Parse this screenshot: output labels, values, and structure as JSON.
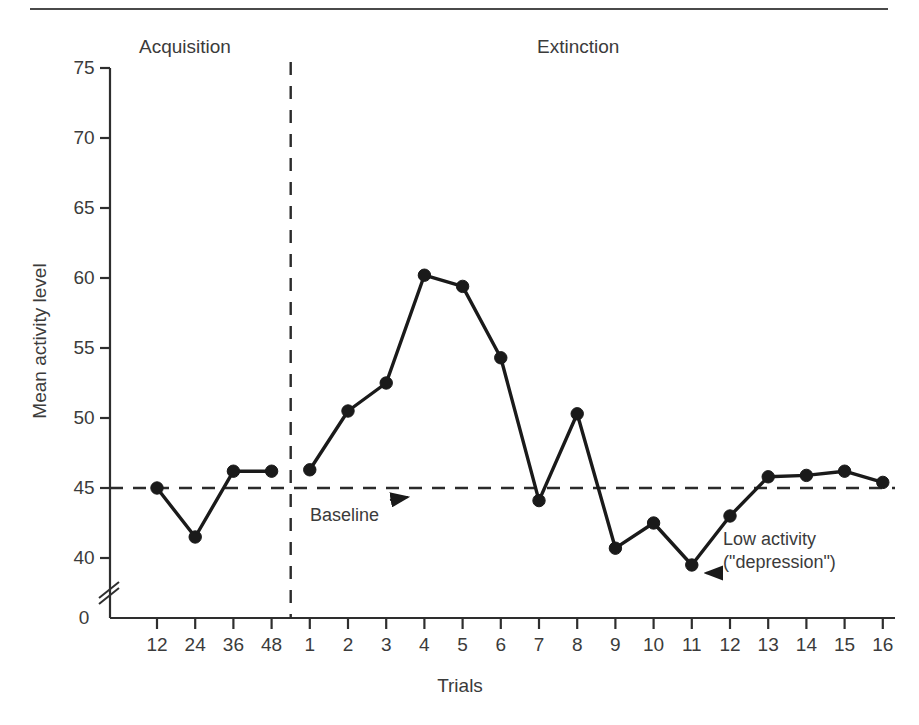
{
  "figure": {
    "phase_labels": {
      "acquisition": "Acquisition",
      "extinction": "Extinction"
    },
    "annotations": {
      "baseline": "Baseline",
      "low_activity_line1": "Low activity",
      "low_activity_line2": "(\"depression\")"
    },
    "colors": {
      "line": "#1a1a1a",
      "text": "#3b3b3b",
      "axis": "#2e2e2e",
      "dashed": "#2b2b2b"
    }
  },
  "chart_data": {
    "type": "line",
    "title": "",
    "xlabel": "Trials",
    "ylabel": "Mean activity level",
    "ylim": [
      38,
      75
    ],
    "y_ticks": [
      40,
      45,
      50,
      55,
      60,
      65,
      70,
      75
    ],
    "y_axis_break": true,
    "y_origin_label": "0",
    "grid": false,
    "legend": "none",
    "x_tick_labels": [
      "12",
      "24",
      "36",
      "48",
      "1",
      "2",
      "3",
      "4",
      "5",
      "6",
      "7",
      "8",
      "9",
      "10",
      "11",
      "12",
      "13",
      "14",
      "15",
      "16"
    ],
    "phases": [
      {
        "name": "Acquisition",
        "x_tick_labels": [
          "12",
          "24",
          "36",
          "48"
        ]
      },
      {
        "name": "Extinction",
        "x_tick_labels": [
          "1",
          "2",
          "3",
          "4",
          "5",
          "6",
          "7",
          "8",
          "9",
          "10",
          "11",
          "12",
          "13",
          "14",
          "15",
          "16"
        ]
      }
    ],
    "baseline_value": 45,
    "phase_divider_after_index": 3,
    "series": [
      {
        "name": "Mean activity level",
        "values": [
          45.0,
          41.5,
          46.2,
          46.2,
          46.3,
          50.5,
          52.5,
          60.2,
          59.4,
          54.3,
          44.1,
          50.3,
          40.7,
          42.5,
          39.5,
          43.0,
          45.8,
          45.9,
          46.2,
          45.4
        ]
      }
    ]
  }
}
